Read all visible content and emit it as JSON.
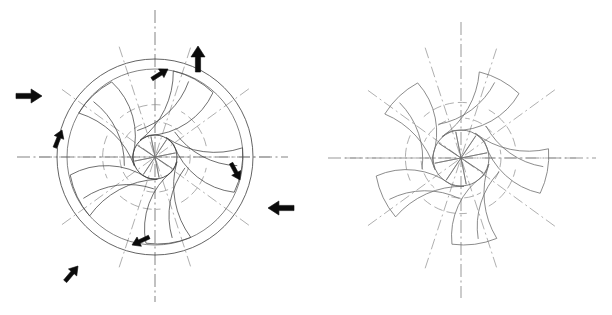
{
  "document": {
    "title": "Impeller Blade Geometry",
    "caption": ""
  },
  "colors": {
    "background": "#ffffff",
    "outline": "#3c3c3c",
    "blade": "#4a4a4a",
    "centerline": "#4d4d4d",
    "centerline_diagonal": "#8d8d8d",
    "construction_arc": "#8b8b8b",
    "arrow": "#0b0b0b",
    "right_figure_stroke": "#6e6e6e"
  },
  "figures": [
    {
      "id": "left-figure",
      "name": "annotated-impeller",
      "label": "",
      "center": {
        "x": 155,
        "y": 157
      },
      "outer_radius": 98,
      "tip_circle_radius": 88,
      "hub_radius": 22,
      "blade_count": 5,
      "spoke_count": 8,
      "has_flow_arrows": true,
      "centerlines": {
        "horizontal": {
          "x1": 17,
          "y1": 157,
          "x2": 288,
          "y2": 157
        },
        "vertical": {
          "x1": 155,
          "y1": 10,
          "x2": 155,
          "y2": 302
        },
        "diagonals_deg": [
          36,
          108,
          180,
          252,
          324
        ]
      },
      "blades": [
        {
          "index": 0,
          "tip_angle_deg": 78,
          "lead_angle_deg": 150
        },
        {
          "index": 1,
          "tip_angle_deg": 150,
          "lead_angle_deg": 222
        },
        {
          "index": 2,
          "tip_angle_deg": 222,
          "lead_angle_deg": 294
        },
        {
          "index": 3,
          "tip_angle_deg": 294,
          "lead_angle_deg": 6
        },
        {
          "index": 4,
          "tip_angle_deg": 6,
          "lead_angle_deg": 78
        }
      ],
      "arrows": [
        {
          "name": "inflow-arrow-top",
          "type": "inflow",
          "x": 198,
          "y": 46,
          "direction_deg": 90,
          "length": 26
        },
        {
          "name": "inflow-arrow-left",
          "type": "inflow",
          "x": 42,
          "y": 96,
          "direction_deg": 0,
          "length": 26
        },
        {
          "name": "inflow-arrow-right",
          "type": "inflow",
          "x": 268,
          "y": 208,
          "direction_deg": 180,
          "length": 26
        },
        {
          "name": "inflow-arrow-bottom-left",
          "type": "inflow",
          "x": 78,
          "y": 266,
          "direction_deg": 50,
          "length": 20
        },
        {
          "name": "tangential-arrow-top",
          "type": "tangential",
          "x": 168,
          "y": 69,
          "direction_deg": 32,
          "length": 19
        },
        {
          "name": "tangential-arrow-upper-left",
          "type": "tangential",
          "x": 62,
          "y": 130,
          "direction_deg": 68,
          "length": 19
        },
        {
          "name": "tangential-arrow-right",
          "type": "tangential",
          "x": 240,
          "y": 180,
          "direction_deg": -62,
          "length": 19
        },
        {
          "name": "tangential-arrow-bottom",
          "type": "tangential",
          "x": 132,
          "y": 245,
          "direction_deg": 205,
          "length": 19
        }
      ]
    },
    {
      "id": "right-figure",
      "name": "plain-impeller",
      "label": "",
      "center": {
        "x": 461,
        "y": 158
      },
      "outer_radius": 98,
      "tip_circle_radius": 88,
      "hub_radius": 28,
      "blade_count": 5,
      "spoke_count": 8,
      "has_flow_arrows": false,
      "centerlines": {
        "horizontal": {
          "x1": 328,
          "y1": 158,
          "x2": 596,
          "y2": 158
        },
        "vertical": {
          "x1": 461,
          "y1": 22,
          "x2": 461,
          "y2": 298
        },
        "diagonals_deg": [
          36,
          108,
          180,
          252,
          324
        ]
      },
      "blades": [
        {
          "index": 0,
          "tip_angle_deg": 78,
          "lead_angle_deg": 150
        },
        {
          "index": 1,
          "tip_angle_deg": 150,
          "lead_angle_deg": 222
        },
        {
          "index": 2,
          "tip_angle_deg": 222,
          "lead_angle_deg": 294
        },
        {
          "index": 3,
          "tip_angle_deg": 294,
          "lead_angle_deg": 6
        },
        {
          "index": 4,
          "tip_angle_deg": 6,
          "lead_angle_deg": 78
        }
      ],
      "arrows": []
    }
  ]
}
